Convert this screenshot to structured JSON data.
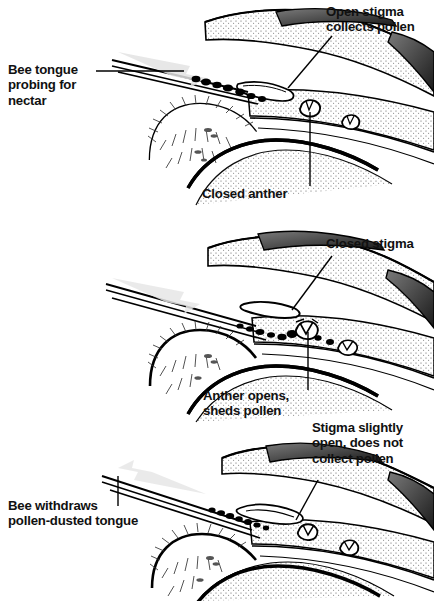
{
  "figure": {
    "type": "scientific-line-illustration",
    "background_color": "#ffffff",
    "ink_color": "#000000",
    "arrow_color": "#e2e2e2",
    "panel_count": 3
  },
  "panels": [
    {
      "id": "panel-1",
      "stage": "Bee inserts tongue; stigma open and receptive; anthers still closed",
      "arrow_direction": "right",
      "labels": {
        "left": {
          "lines": [
            "Bee tongue",
            "probing for",
            "nectar"
          ]
        },
        "top_right": {
          "lines": [
            "Open stigma",
            "collects pollen"
          ]
        },
        "bottom": {
          "lines": [
            "Closed anther"
          ]
        }
      }
    },
    {
      "id": "panel-2",
      "stage": "Anthers split and shed pollen onto the tongue; stigma now closed",
      "arrow_direction": "right",
      "labels": {
        "top_right": {
          "lines": [
            "Closed stigma"
          ]
        },
        "bottom": {
          "lines": [
            "Anther opens,",
            "sheds pollen"
          ]
        }
      }
    },
    {
      "id": "panel-3",
      "stage": "Bee withdraws pollen-laden tongue; stigma only slightly open",
      "arrow_direction": "left",
      "labels": {
        "left": {
          "lines": [
            "Bee withdraws",
            "pollen-dusted tongue"
          ]
        },
        "top_right": {
          "lines": [
            "Stigma slightly",
            "open, does not",
            "collect pollen"
          ]
        }
      }
    }
  ]
}
